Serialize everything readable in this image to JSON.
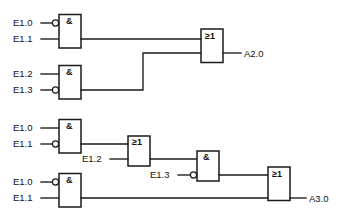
{
  "diagram": {
    "stroke_color": "#1a1a1a",
    "background_color": "#ffffff",
    "circuits": [
      {
        "id": "circuit-a2-0",
        "output": "A2.0",
        "gates": [
          {
            "id": "and-1",
            "symbol": "&",
            "type": "and",
            "inputs": [
              {
                "label": "E1.0",
                "negated": true
              },
              {
                "label": "E1.1",
                "negated": false
              }
            ]
          },
          {
            "id": "and-2",
            "symbol": "&",
            "type": "and",
            "inputs": [
              {
                "label": "E1.2",
                "negated": false
              },
              {
                "label": "E1.3",
                "negated": true
              }
            ]
          },
          {
            "id": "or-1",
            "symbol": "≥1",
            "type": "or",
            "inputs": [
              {
                "label": "",
                "negated": false
              },
              {
                "label": "",
                "negated": false
              }
            ]
          }
        ]
      },
      {
        "id": "circuit-a3-0",
        "output": "A3.0",
        "gates": [
          {
            "id": "and-3",
            "symbol": "&",
            "type": "and",
            "inputs": [
              {
                "label": "E1.0",
                "negated": false
              },
              {
                "label": "E1.1",
                "negated": true
              }
            ]
          },
          {
            "id": "or-2",
            "symbol": "≥1",
            "type": "or",
            "inputs": [
              {
                "label": "",
                "negated": false
              },
              {
                "label": "E1.2",
                "negated": false
              }
            ]
          },
          {
            "id": "and-4",
            "symbol": "&",
            "type": "and",
            "inputs": [
              {
                "label": "",
                "negated": false
              },
              {
                "label": "E1.3",
                "negated": true
              }
            ]
          },
          {
            "id": "and-5",
            "symbol": "&",
            "type": "and",
            "inputs": [
              {
                "label": "E1.0",
                "negated": true
              },
              {
                "label": "E1.1",
                "negated": false
              }
            ]
          },
          {
            "id": "or-3",
            "symbol": "≥1",
            "type": "or",
            "inputs": [
              {
                "label": "",
                "negated": false
              },
              {
                "label": "",
                "negated": false
              }
            ]
          }
        ]
      }
    ],
    "labels": {
      "and_symbol": "&",
      "or_symbol": "≥1",
      "g1_in1": "E1.0",
      "g1_in2": "E1.1",
      "g2_in1": "E1.2",
      "g2_in2": "E1.3",
      "out_a20": "A2.0",
      "g3_in1": "E1.0",
      "g3_in2": "E1.1",
      "or2_in2": "E1.2",
      "and4_in2": "E1.3",
      "g5_in1": "E1.0",
      "g5_in2": "E1.1",
      "out_a30": "A3.0"
    }
  }
}
